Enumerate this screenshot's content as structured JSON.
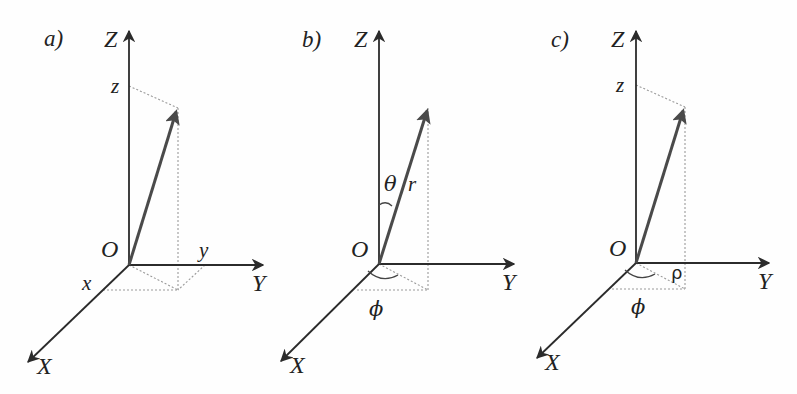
{
  "figure": {
    "colors": {
      "axis": "#2b2b2b",
      "vector": "#4a4a4a",
      "projection": "#9a9a9a",
      "background": "#fefefe"
    }
  },
  "panels": [
    {
      "id": "a",
      "label": "a)",
      "system": "cartesian",
      "axes": {
        "x": "X",
        "y": "Y",
        "z": "Z"
      },
      "origin": "O",
      "components": {
        "x": "x",
        "y": "y",
        "z": "z"
      }
    },
    {
      "id": "b",
      "label": "b)",
      "system": "spherical",
      "axes": {
        "x": "X",
        "y": "Y",
        "z": "Z"
      },
      "origin": "O",
      "components": {
        "r": "r",
        "theta": "θ",
        "phi": "ϕ"
      }
    },
    {
      "id": "c",
      "label": "c)",
      "system": "cylindrical",
      "axes": {
        "x": "X",
        "y": "Y",
        "z": "Z"
      },
      "origin": "O",
      "components": {
        "z": "z",
        "rho": "ρ",
        "phi": "ϕ"
      }
    }
  ]
}
